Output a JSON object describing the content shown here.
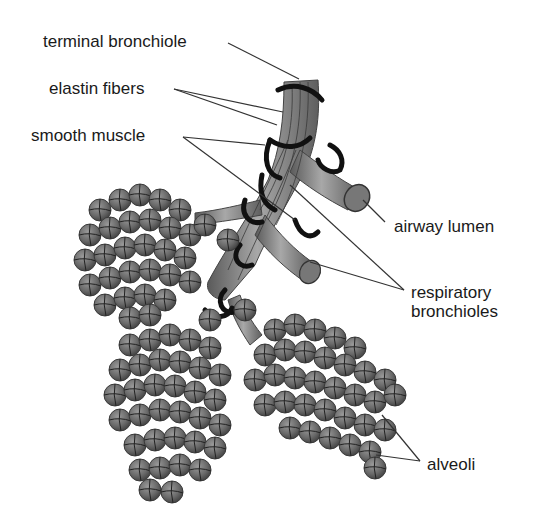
{
  "diagram": {
    "labels": {
      "terminal_bronchiole": "terminal bronchiole",
      "elastin_fibers": "elastin fibers",
      "smooth_muscle": "smooth muscle",
      "airway_lumen": "airway lumen",
      "respiratory_bronchioles_line1": "respiratory",
      "respiratory_bronchioles_line2": "bronchioles",
      "alveoli": "alveoli"
    },
    "colors": {
      "background": "#ffffff",
      "airway_fill": "#8a8a8a",
      "alveolus_fill": "#6e6e6e",
      "muscle_band": "#111111",
      "leader_line": "#333333",
      "text": "#1a1a1a"
    }
  }
}
